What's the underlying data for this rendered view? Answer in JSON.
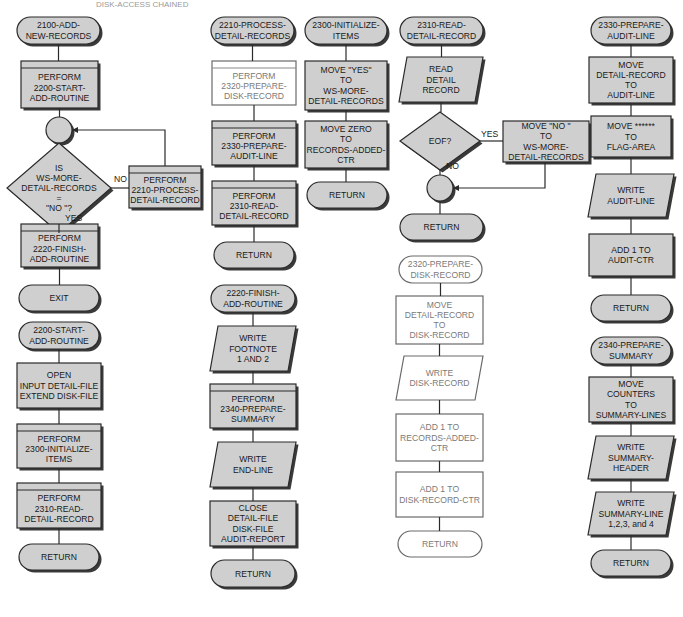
{
  "header_partial_text": "DISK-ACCESS CHAINED",
  "colors": {
    "fill": "#cfcfcf",
    "stroke": "#2a2a2a",
    "white_fill": "#ffffff",
    "light_text": "#7a7a7a"
  },
  "modules": [
    {
      "id": "m2100",
      "terminal": "2100-ADD-|NEW-RECORDS",
      "steps": [
        {
          "type": "predefined",
          "text": "PERFORM|2200-START-|ADD-ROUTINE"
        },
        {
          "type": "connector",
          "text": ""
        },
        {
          "type": "decision",
          "text": "IS|WS-MORE-|DETAIL-RECORDS|=|\"NO \"?"
        },
        {
          "type": "predefined",
          "text": "PERFORM|2220-FINISH-|ADD-ROUTINE"
        },
        {
          "type": "terminal",
          "text": "EXIT"
        }
      ],
      "side": {
        "type": "predefined",
        "text": "PERFORM|2210-PROCESS-|DETAIL-RECORD"
      },
      "edge_labels": {
        "no": "NO",
        "yes": "YES"
      }
    },
    {
      "id": "m2200",
      "terminal": "2200-START-|ADD-ROUTINE",
      "steps": [
        {
          "type": "process",
          "text": "OPEN|INPUT DETAIL-FILE|EXTEND DISK-FILE"
        },
        {
          "type": "predefined",
          "text": "PERFORM|2300-INITIALIZE-|ITEMS"
        },
        {
          "type": "predefined",
          "text": "PERFORM|2310-READ-|DETAIL-RECORD"
        },
        {
          "type": "terminal",
          "text": "RETURN"
        }
      ]
    },
    {
      "id": "m2210",
      "terminal": "2210-PROCESS-|DETAIL-RECORDS",
      "steps": [
        {
          "type": "predefined-white",
          "text": "PERFORM|2320-PREPARE-|DISK-RECORD"
        },
        {
          "type": "predefined",
          "text": "PERFORM|2330-PREPARE-|AUDIT-LINE"
        },
        {
          "type": "predefined",
          "text": "PERFORM|2310-READ-|DETAIL-RECORD"
        },
        {
          "type": "terminal",
          "text": "RETURN"
        }
      ]
    },
    {
      "id": "m2220",
      "terminal": "2220-FINISH-|ADD-ROUTINE",
      "steps": [
        {
          "type": "io",
          "text": "WRITE|FOOTNOTE|1 AND 2"
        },
        {
          "type": "predefined",
          "text": "PERFORM|2340-PREPARE-|SUMMARY"
        },
        {
          "type": "io",
          "text": "WRITE|END-LINE"
        },
        {
          "type": "process",
          "text": "CLOSE|DETAIL-FILE|DISK-FILE|AUDIT-REPORT"
        },
        {
          "type": "terminal",
          "text": "RETURN"
        }
      ]
    },
    {
      "id": "m2300",
      "terminal": "2300-INITIALIZE-|ITEMS",
      "steps": [
        {
          "type": "process",
          "text": "MOVE \"YES\"|TO|WS-MORE-|DETAIL-RECORDS"
        },
        {
          "type": "process",
          "text": "MOVE ZERO|TO|RECORDS-ADDED-|CTR"
        },
        {
          "type": "terminal",
          "text": "RETURN"
        }
      ]
    },
    {
      "id": "m2310",
      "terminal": "2310-READ-|DETAIL-RECORD",
      "steps": [
        {
          "type": "io",
          "text": "READ|DETAIL|RECORD"
        },
        {
          "type": "decision",
          "text": "EOF?"
        },
        {
          "type": "connector",
          "text": ""
        },
        {
          "type": "terminal",
          "text": "RETURN"
        }
      ],
      "side": {
        "type": "process",
        "text": "MOVE \"NO \"|TO|WS-MORE-|DETAIL-RECORDS"
      },
      "edge_labels": {
        "no": "NO",
        "yes": "YES"
      }
    },
    {
      "id": "m2320",
      "terminal": "2320-PREPARE-|DISK-RECORD",
      "white": true,
      "steps": [
        {
          "type": "process",
          "text": "MOVE|DETAIL-RECORD|TO|DISK-RECORD"
        },
        {
          "type": "io",
          "text": "WRITE|DISK-RECORD"
        },
        {
          "type": "process",
          "text": "ADD 1 TO|RECORDS-ADDED-|CTR"
        },
        {
          "type": "process",
          "text": "ADD 1 TO|DISK-RECORD-CTR"
        },
        {
          "type": "terminal",
          "text": "RETURN"
        }
      ]
    },
    {
      "id": "m2330",
      "terminal": "2330-PREPARE-|AUDIT-LINE",
      "steps": [
        {
          "type": "process",
          "text": "MOVE|DETAIL-RECORD|TO|AUDIT-LINE"
        },
        {
          "type": "process",
          "text": "MOVE ******|TO|FLAG-AREA"
        },
        {
          "type": "io",
          "text": "WRITE|AUDIT-LINE"
        },
        {
          "type": "process",
          "text": "ADD 1 TO|AUDIT-CTR"
        },
        {
          "type": "terminal",
          "text": "RETURN"
        }
      ]
    },
    {
      "id": "m2340",
      "terminal": "2340-PREPARE-|SUMMARY",
      "steps": [
        {
          "type": "process",
          "text": "MOVE|COUNTERS|TO|SUMMARY-LINES"
        },
        {
          "type": "io",
          "text": "WRITE|SUMMARY-|HEADER"
        },
        {
          "type": "io",
          "text": "WRITE|SUMMARY-LINE|1,2,3, and 4"
        },
        {
          "type": "terminal",
          "text": "RETURN"
        }
      ]
    }
  ]
}
